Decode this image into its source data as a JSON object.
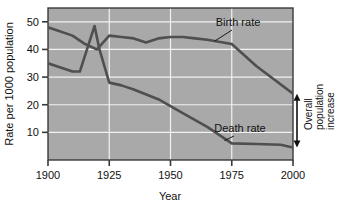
{
  "chart_data": {
    "type": "line",
    "title": "",
    "xlabel": "Year",
    "ylabel": "Rate per 1000 population",
    "xlim": [
      1900,
      2000
    ],
    "ylim": [
      0,
      55
    ],
    "xticks": [
      1900,
      1925,
      1950,
      1975,
      2000
    ],
    "yticks": [
      10,
      20,
      30,
      40,
      50
    ],
    "xtick_labels": [
      "1900",
      "1925",
      "1950",
      "1975",
      "2000"
    ],
    "ytick_labels": [
      "10",
      "20",
      "30",
      "40",
      "50"
    ],
    "grid": true,
    "grid_color": "#f2f2f2",
    "plot_background": "#a9a9a9",
    "legend": "inline-labels",
    "series": [
      {
        "name": "Birth rate",
        "color": "#4f4f4f",
        "label": "Birth rate",
        "x": [
          1900,
          1910,
          1915,
          1920,
          1925,
          1930,
          1935,
          1940,
          1945,
          1950,
          1955,
          1960,
          1965,
          1975,
          1985,
          2000
        ],
        "values": [
          48,
          45,
          42,
          40,
          45,
          44.5,
          44,
          42.5,
          44,
          44.5,
          44.5,
          44,
          43.5,
          42,
          34,
          24
        ]
      },
      {
        "name": "Death rate",
        "color": "#4f4f4f",
        "label": "Death rate",
        "x": [
          1900,
          1910,
          1913,
          1919,
          1921,
          1925,
          1930,
          1935,
          1945,
          1955,
          1965,
          1975,
          1985,
          1995,
          2000
        ],
        "values": [
          35,
          32,
          32,
          48.5,
          40,
          28,
          27,
          25.5,
          22,
          17,
          12,
          6,
          5.8,
          5.5,
          4.5
        ]
      }
    ],
    "annotations": [
      {
        "name": "Birth rate",
        "text": "Birth rate",
        "points_to_year": 1968,
        "points_to_value": 43
      },
      {
        "name": "Death rate",
        "text": "Death rate",
        "points_to_year": 1972,
        "points_to_value": 7
      },
      {
        "name": "Overall population increase",
        "text_lines": [
          "Overall",
          "population",
          "increase"
        ],
        "at_year": 2000,
        "span_from_value": 4.5,
        "span_to_value": 24,
        "arrow": "double-headed"
      }
    ]
  },
  "axes": {
    "x_title": "Year",
    "y_title": "Rate per 1000 population"
  },
  "labels": {
    "birth_rate": "Birth rate",
    "death_rate": "Death rate",
    "overall_line1": "Overall",
    "overall_line2": "population",
    "overall_line3": "increase"
  },
  "ticks": {
    "x": [
      "1900",
      "1925",
      "1950",
      "1975",
      "2000"
    ],
    "y": [
      "50",
      "40",
      "30",
      "20",
      "10"
    ]
  },
  "colors": {
    "plot_bg": "#a9a9a9",
    "grid": "#f2f2f2",
    "line": "#4f4f4f",
    "text": "#111111",
    "page_bg": "#ffffff"
  }
}
